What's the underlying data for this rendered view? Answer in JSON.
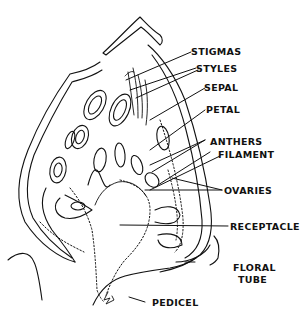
{
  "diagram": {
    "labels": [
      {
        "id": "stigmas",
        "text": "STIGMAS"
      },
      {
        "id": "styles",
        "text": "STYLES"
      },
      {
        "id": "sepal",
        "text": "SEPAL"
      },
      {
        "id": "petal",
        "text": "PETAL"
      },
      {
        "id": "anthers",
        "text": "ANTHERS"
      },
      {
        "id": "filament",
        "text": "FILAMENT"
      },
      {
        "id": "ovaries",
        "text": "OVARIES"
      },
      {
        "id": "receptacle",
        "text": "RECEPTACLE"
      },
      {
        "id": "floral_tube_1",
        "text": "FLORAL"
      },
      {
        "id": "floral_tube_2",
        "text": "TUBE"
      },
      {
        "id": "pedicel",
        "text": "PEDICEL"
      }
    ],
    "colors": {
      "ink": "#111111",
      "background": "#ffffff"
    }
  }
}
